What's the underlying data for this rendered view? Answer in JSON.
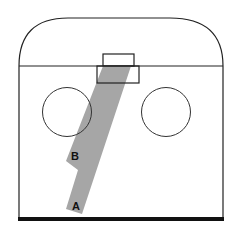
{
  "diagram": {
    "type": "hockey-rink-zone",
    "labels": {
      "a": "A",
      "b": "B"
    },
    "colors": {
      "outline": "#222222",
      "lane": "#a6a6a6",
      "background": "#ffffff",
      "end_line": "#111111"
    }
  }
}
